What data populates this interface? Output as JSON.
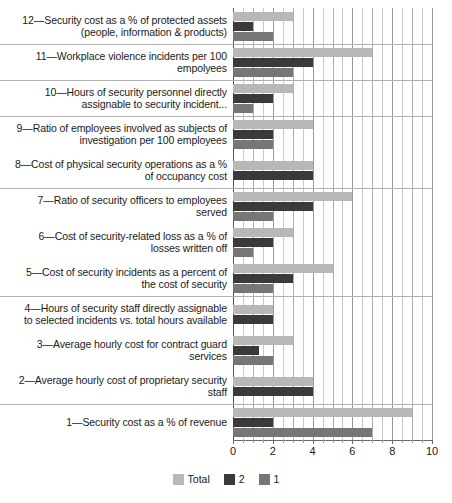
{
  "chart_data": {
    "type": "bar",
    "orientation": "horizontal",
    "title": "",
    "subtitle": "",
    "xlabel": "",
    "ylabel": "",
    "xlim": [
      0,
      10
    ],
    "xticks": [
      0,
      2,
      4,
      6,
      8,
      10
    ],
    "xtick_labels": [
      "0",
      "2",
      "4",
      "6",
      "8",
      "10"
    ],
    "grid": "vertical",
    "legend_position": "bottom-center",
    "legend": [
      "Total",
      "2",
      "1"
    ],
    "colors": {
      "total": "#b8b8b8",
      "series_2": "#3a3a3a",
      "series_1": "#767676",
      "gridline": "#9a9a9a",
      "axis": "#6a6a6a",
      "text": "#1a1a1a",
      "background": "#ffffff"
    },
    "categories": [
      "12—Security cost as a % of protected assets (people, information & products)",
      "11—Workplace violence incidents per 100 empolyees",
      "10—Hours of security personnel directly assignable to security incident...",
      "9—Ratio of employees involved as subjects of investigation per 100 employees",
      "8—Cost of physical security operations as a % of occupancy cost",
      "7—Ratio of security officers to employees served",
      "6—Cost of security-related loss as a % of losses written off",
      "5—Cost of security incidents as a percent of the cost of security",
      "4—Hours of security staff directly assignable to selected incidents vs. total hours available",
      "3—Average hourly cost for contract guard services",
      "2—Average hourly cost of proprietary security staff",
      "1—Security cost as a % of revenue"
    ],
    "series": [
      {
        "name": "Total",
        "key": "total",
        "values": [
          3.0,
          7.0,
          3.0,
          4.0,
          4.0,
          6.0,
          3.0,
          5.0,
          2.0,
          3.0,
          4.0,
          9.0
        ]
      },
      {
        "name": "2",
        "key": "series_2",
        "values": [
          1.0,
          4.0,
          2.0,
          2.0,
          4.0,
          4.0,
          2.0,
          3.0,
          2.0,
          1.3,
          4.0,
          2.0
        ]
      },
      {
        "name": "1",
        "key": "series_1",
        "values": [
          2.0,
          3.0,
          1.0,
          2.0,
          0.0,
          2.0,
          1.0,
          2.0,
          0.0,
          2.0,
          0.0,
          7.0
        ]
      }
    ]
  },
  "rows": [
    {
      "label_lines": [
        "12—Security cost as a % of protected assets",
        "(people, information & products)"
      ],
      "total": 3.0,
      "s2": 1.0,
      "s1": 2.0
    },
    {
      "label_lines": [
        "11—Workplace violence incidents per 100",
        "empolyees"
      ],
      "total": 7.0,
      "s2": 4.0,
      "s1": 3.0
    },
    {
      "label_lines": [
        "10—Hours of security personnel directly",
        "assignable to security incident..."
      ],
      "total": 3.0,
      "s2": 2.0,
      "s1": 1.0
    },
    {
      "label_lines": [
        "9—Ratio of employees involved as subjects of",
        "investigation per 100 employees"
      ],
      "total": 4.0,
      "s2": 2.0,
      "s1": 2.0
    },
    {
      "label_lines": [
        "8—Cost of physical security operations as a %",
        "of occupancy cost"
      ],
      "total": 4.0,
      "s2": 4.0,
      "s1": 0.0
    },
    {
      "label_lines": [
        "7—Ratio of security officers to employees",
        "served"
      ],
      "total": 6.0,
      "s2": 4.0,
      "s1": 2.0
    },
    {
      "label_lines": [
        "6—Cost of security-related loss as a % of",
        "losses written off"
      ],
      "total": 3.0,
      "s2": 2.0,
      "s1": 1.0
    },
    {
      "label_lines": [
        "5—Cost of security incidents as a percent of",
        "the cost of security"
      ],
      "total": 5.0,
      "s2": 3.0,
      "s1": 2.0
    },
    {
      "label_lines": [
        "4—Hours of security staff directly assignable",
        "to selected incidents vs. total hours available"
      ],
      "total": 2.0,
      "s2": 2.0,
      "s1": 0.0
    },
    {
      "label_lines": [
        "3—Average hourly cost for contract guard",
        "services"
      ],
      "total": 3.0,
      "s2": 1.3,
      "s1": 2.0
    },
    {
      "label_lines": [
        "2—Average hourly cost of proprietary security",
        "staff"
      ],
      "total": 4.0,
      "s2": 4.0,
      "s1": 0.0
    },
    {
      "label_lines": [
        "1—Security cost as a % of revenue"
      ],
      "total": 9.0,
      "s2": 2.0,
      "s1": 7.0
    }
  ],
  "axis": {
    "ticks": [
      "0",
      "2",
      "4",
      "6",
      "8",
      "10"
    ],
    "min": 0,
    "max": 10
  },
  "legend": {
    "items": [
      {
        "label": "Total",
        "swatch": "total"
      },
      {
        "label": "2",
        "swatch": "s2"
      },
      {
        "label": "1",
        "swatch": "s1"
      }
    ]
  }
}
